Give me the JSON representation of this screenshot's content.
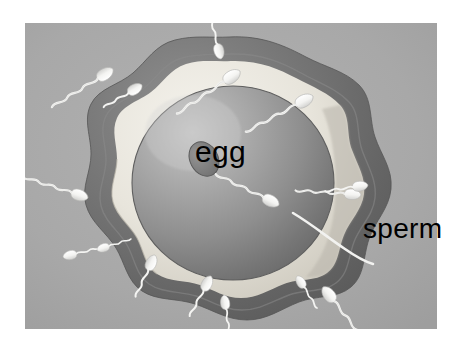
{
  "figure": {
    "type": "scientific-illustration",
    "style": "grayscale airbrush diagram",
    "panel": {
      "x": 25,
      "y": 23,
      "width": 412,
      "height": 306,
      "background_color": "#a8a8a8",
      "border_color": "#ffffff"
    }
  },
  "labels": {
    "egg": "egg",
    "sperm": "sperm"
  },
  "colors": {
    "page_background": "#ffffff",
    "panel_background": "#a8a8a8",
    "zona_outer_dark": "#6e6e6e",
    "zona_outer_mid": "#8a8a8a",
    "perivitelline_light": "#ebe8e0",
    "egg_body": "#9a9a9a",
    "egg_shadow": "#6b6b6b",
    "egg_highlight": "#c2c2c2",
    "polar_body": "#7d7d7d",
    "sperm_body": "#f2f2f0",
    "sperm_outline": "#cfcfcf",
    "text": "#000000"
  },
  "structures": [
    {
      "name": "zona-pellucida",
      "description": "lumpy dark gray outer coat of the egg"
    },
    {
      "name": "perivitelline-space",
      "description": "pale cream ring inside the zona"
    },
    {
      "name": "egg-cell-body",
      "description": "large gray sphere shaded darker at lower right"
    },
    {
      "name": "polar-body",
      "description": "small tilted dark oval at the upper left of the egg"
    },
    {
      "name": "fertilizing-sperm",
      "description": "sperm penetrating the egg at the right"
    }
  ],
  "sperm_cells": [
    {
      "id": 1,
      "position": "top-left-outer",
      "head_angle_deg": 145
    },
    {
      "id": 2,
      "position": "top-left-upper",
      "head_angle_deg": 150
    },
    {
      "id": 3,
      "position": "top-center",
      "head_angle_deg": 200
    },
    {
      "id": 4,
      "position": "top-right-upper",
      "head_angle_deg": 220
    },
    {
      "id": 5,
      "position": "right-upper",
      "head_angle_deg": 225
    },
    {
      "id": 6,
      "position": "left-middle",
      "head_angle_deg": 95
    },
    {
      "id": 7,
      "position": "right-middle",
      "head_angle_deg": 250
    },
    {
      "id": 8,
      "position": "right-entering-egg",
      "head_angle_deg": 250
    },
    {
      "id": 9,
      "position": "bottom-left-outer",
      "head_angle_deg": 40
    },
    {
      "id": 10,
      "position": "bottom-left-inner",
      "head_angle_deg": 30
    },
    {
      "id": 11,
      "position": "bottom-left-lower",
      "head_angle_deg": 25
    },
    {
      "id": 12,
      "position": "bottom-center",
      "head_angle_deg": 355
    },
    {
      "id": 13,
      "position": "bottom-right",
      "head_angle_deg": 320
    },
    {
      "id": 14,
      "position": "bottom-right-outer",
      "head_angle_deg": 315
    }
  ],
  "count": {
    "sperm_visible": 14,
    "eggs": 1
  }
}
